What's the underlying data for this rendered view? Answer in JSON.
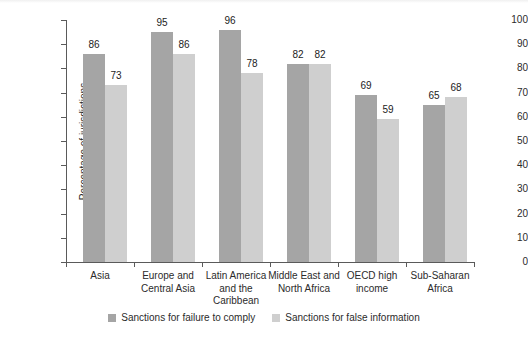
{
  "chart_data": {
    "type": "bar",
    "title": "",
    "xlabel": "",
    "ylabel": "Percentage of jurisdictions",
    "ylim": [
      0,
      100
    ],
    "yticks": [
      0,
      10,
      20,
      30,
      40,
      50,
      60,
      70,
      80,
      90,
      100
    ],
    "grid": false,
    "legend_position": "bottom-center",
    "categories": [
      "Asia",
      "Europe and Central Asia",
      "Latin America and the Caribbean",
      "Middle East and North Africa",
      "OECD high income",
      "Sub-Saharan Africa"
    ],
    "category_lines": [
      [
        "Asia"
      ],
      [
        "Europe and",
        "Central Asia"
      ],
      [
        "Latin America",
        "and the",
        "Caribbean"
      ],
      [
        "Middle East and",
        "North Africa"
      ],
      [
        "OECD high",
        "income"
      ],
      [
        "Sub-Saharan",
        "Africa"
      ]
    ],
    "series": [
      {
        "name": "Sanctions for failure to comply",
        "color": "#a5a5a5",
        "values": [
          86,
          95,
          96,
          82,
          69,
          65
        ]
      },
      {
        "name": "Sanctions for false information",
        "color": "#cfcfcf",
        "values": [
          73,
          86,
          78,
          82,
          59,
          68
        ]
      }
    ]
  },
  "axis": {
    "y_label": "Percentage of jurisdictions",
    "y_tick_labels": [
      "100",
      "90",
      "80",
      "70",
      "60",
      "50",
      "40",
      "30",
      "20",
      "10",
      "0"
    ]
  },
  "legend": {
    "items": [
      {
        "label": "Sanctions for failure to comply",
        "swatch": "dark"
      },
      {
        "label": "Sanctions for false information",
        "swatch": "light"
      }
    ]
  }
}
